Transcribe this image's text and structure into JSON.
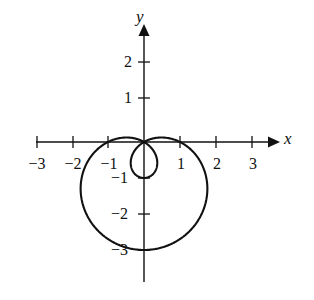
{
  "figure": {
    "kind": "polar-curve-plot",
    "background_color": "#ffffff",
    "stroke_color": "#111111",
    "axis_labels": {
      "x": "x",
      "y": "y"
    }
  },
  "axes": {
    "x_ticks": [
      {
        "value": -3,
        "label": "−3",
        "px": 37
      },
      {
        "value": -2,
        "label": "−2",
        "px": 73
      },
      {
        "value": -1,
        "label": "−1",
        "px": 108
      },
      {
        "value": 1,
        "label": "1",
        "px": 180
      },
      {
        "value": 2,
        "label": "2",
        "px": 216
      },
      {
        "value": 3,
        "label": "3",
        "px": 252
      }
    ],
    "y_ticks": [
      {
        "value": 2,
        "label": "2",
        "px": 62
      },
      {
        "value": 1,
        "label": "1",
        "px": 98
      },
      {
        "value": -1,
        "label": "−1",
        "px": 178
      },
      {
        "value": -2,
        "label": "−2",
        "px": 214
      },
      {
        "value": -3,
        "label": "−3",
        "px": 250
      }
    ],
    "origin_px": {
      "x": 144,
      "y": 142
    },
    "unit_px": 36,
    "x_range": [
      -3.1,
      3.6
    ],
    "y_range": [
      -4.4,
      3.1
    ]
  },
  "chart_data": {
    "type": "line",
    "title": "",
    "xlabel": "x",
    "ylabel": "y",
    "xlim": [
      -3.1,
      3.6
    ],
    "ylim": [
      -4.4,
      3.1
    ],
    "grid": false,
    "legend": null,
    "curve": {
      "name": "limacon-with-inner-loop",
      "polar_equation": "r = 1 − 2 sin(θ)",
      "closed": true,
      "annotations": [
        "outer loop extends from x ≈ −1.78 to x ≈ 1.78",
        "outer loop minimum at (0, −3)",
        "inner loop passes through origin and reaches (0, −1)",
        "curve passes through the origin twice"
      ],
      "key_points": [
        {
          "theta_deg": 0,
          "x": 1.0,
          "y": 0.0
        },
        {
          "theta_deg": 30,
          "x": 0.0,
          "y": 0.0
        },
        {
          "theta_deg": 90,
          "x": 0.0,
          "y": -1.0
        },
        {
          "theta_deg": 150,
          "x": 0.0,
          "y": 0.0
        },
        {
          "theta_deg": 180,
          "x": -1.0,
          "y": 0.0
        },
        {
          "theta_deg": 210,
          "x": -1.73,
          "y": -1.0
        },
        {
          "theta_deg": 270,
          "x": 0.0,
          "y": -3.0
        },
        {
          "theta_deg": 330,
          "x": 1.73,
          "y": -1.0
        }
      ],
      "x_extent": [
        -1.78,
        1.78
      ],
      "y_extent": [
        -3.05,
        0.0
      ]
    }
  }
}
